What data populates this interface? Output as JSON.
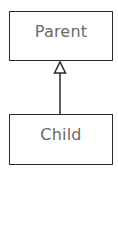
{
  "diagram": {
    "type": "uml-class-inheritance",
    "nodes": [
      {
        "id": "parent",
        "label": "Parent"
      },
      {
        "id": "child",
        "label": "Child"
      }
    ],
    "edges": [
      {
        "from": "child",
        "to": "parent",
        "type": "generalization",
        "arrowhead": "hollow-triangle"
      }
    ],
    "colors": {
      "border": "#2a2a2a",
      "text": "#6a6a6a",
      "background": "#ffffff"
    }
  }
}
